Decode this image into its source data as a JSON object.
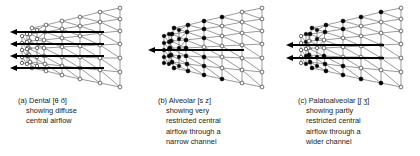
{
  "figure": {
    "background_color": "#ffffff",
    "line_color": "#555555",
    "arrow_color": "#000000",
    "node_open_fill": "#ffffff",
    "node_filled_fill": "#000000",
    "node_stroke": "#333333"
  },
  "panels": [
    {
      "id": "panel-a",
      "caption_lines": [
        "(a) Dental [θ ð]",
        "showing diffuse",
        "central airflow"
      ],
      "ipa_symbols": "θ ð",
      "place_of_articulation": "Dental",
      "airflow_description": "showing diffuse central airflow",
      "arrow_count": 4,
      "node_style": "open",
      "arrows": [
        {
          "y": 32,
          "x1": 10,
          "x2": 104
        },
        {
          "y": 44,
          "x1": 10,
          "x2": 104
        },
        {
          "y": 56,
          "x1": 10,
          "x2": 104
        },
        {
          "y": 68,
          "x1": 10,
          "x2": 104
        }
      ]
    },
    {
      "id": "panel-b",
      "caption_lines": [
        "(b) Alveolar [s z]",
        "showing very",
        "restricted central",
        "airflow through a",
        "narrow channel"
      ],
      "ipa_symbols": "s z",
      "place_of_articulation": "Alveolar",
      "airflow_description": "showing very restricted central airflow through a narrow channel",
      "arrow_count": 1,
      "node_style": "mixed-filled-left",
      "arrows": [
        {
          "y": 50,
          "x1": 8,
          "x2": 104
        }
      ]
    },
    {
      "id": "panel-c",
      "caption_lines": [
        "(c) Palatoalveolar [ʃ ʒ]",
        "showing partly",
        "restricted central",
        "airflow through a",
        "wider channel"
      ],
      "ipa_symbols": "ʃ ʒ",
      "place_of_articulation": "Palatoalveolar",
      "airflow_description": "showing partly restricted central airflow through a wider channel",
      "arrow_count": 2,
      "node_style": "mixed-filled-left",
      "arrows": [
        {
          "y": 45,
          "x1": 6,
          "x2": 104
        },
        {
          "y": 58,
          "x1": 6,
          "x2": 104
        }
      ]
    }
  ]
}
